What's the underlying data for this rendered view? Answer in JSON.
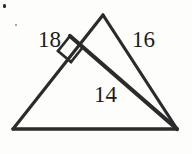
{
  "figure": {
    "kind": "geometry-diagram",
    "background_color": "#fdfdfb",
    "stroke_color": "#2b2b2b",
    "label_color": "#1c1c1c",
    "labels": [
      {
        "id": "label-18",
        "text": "18",
        "name": "side-length-label-18"
      },
      {
        "id": "label-16",
        "text": "16",
        "name": "side-length-label-16"
      },
      {
        "id": "label-14",
        "text": "14",
        "name": "segment-length-label-14"
      }
    ],
    "vertices": {
      "apex": {
        "x": 103,
        "y": 15
      },
      "bottom_left": {
        "x": 13,
        "y": 129
      },
      "bottom_right": {
        "x": 177,
        "y": 129
      },
      "right_angle_foot": {
        "x": 72,
        "y": 38
      }
    },
    "right_angle_marker": {
      "present": true,
      "size": 15,
      "name": "right-angle-marker"
    },
    "edges": [
      {
        "name": "edge-left",
        "from": "apex",
        "to": "bottom_left"
      },
      {
        "name": "edge-right",
        "from": "apex",
        "to": "bottom_right"
      },
      {
        "name": "edge-base",
        "from": "bottom_left",
        "to": "bottom_right"
      },
      {
        "name": "cevian",
        "from": "right_angle_foot",
        "to": "bottom_right"
      }
    ]
  }
}
